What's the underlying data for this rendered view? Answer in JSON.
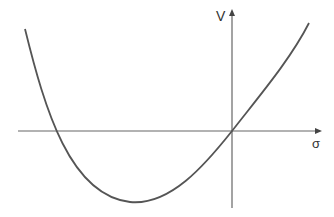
{
  "diagram": {
    "type": "function-plot",
    "axes": {
      "x_label": "σ",
      "y_label": "V"
    },
    "curve": {
      "description": "convex curve crossing origin, minimum in negative sigma region",
      "color": "#555555"
    },
    "colors": {
      "axis": "#666666",
      "background": "#ffffff"
    }
  }
}
